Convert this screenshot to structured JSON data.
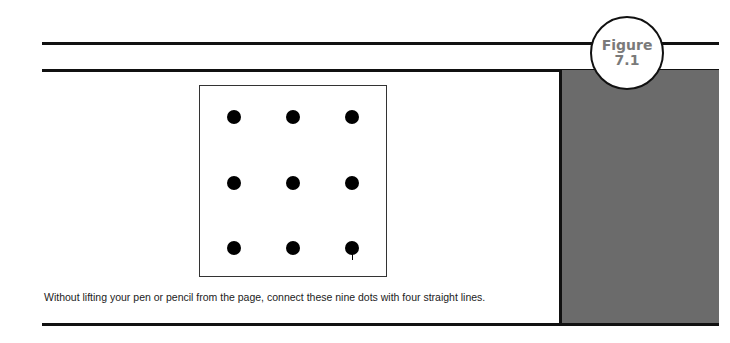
{
  "figure_badge": {
    "label": "Figure",
    "number": "7.1"
  },
  "puzzle": {
    "dot_count": 9,
    "rows": 3,
    "cols": 3
  },
  "caption": "Without lifting your pen or pencil from the page, connect these nine dots with four straight lines.",
  "colors": {
    "rule": "#111111",
    "panel": "#6b6b6b",
    "badge_text": "#7a7a7a"
  }
}
